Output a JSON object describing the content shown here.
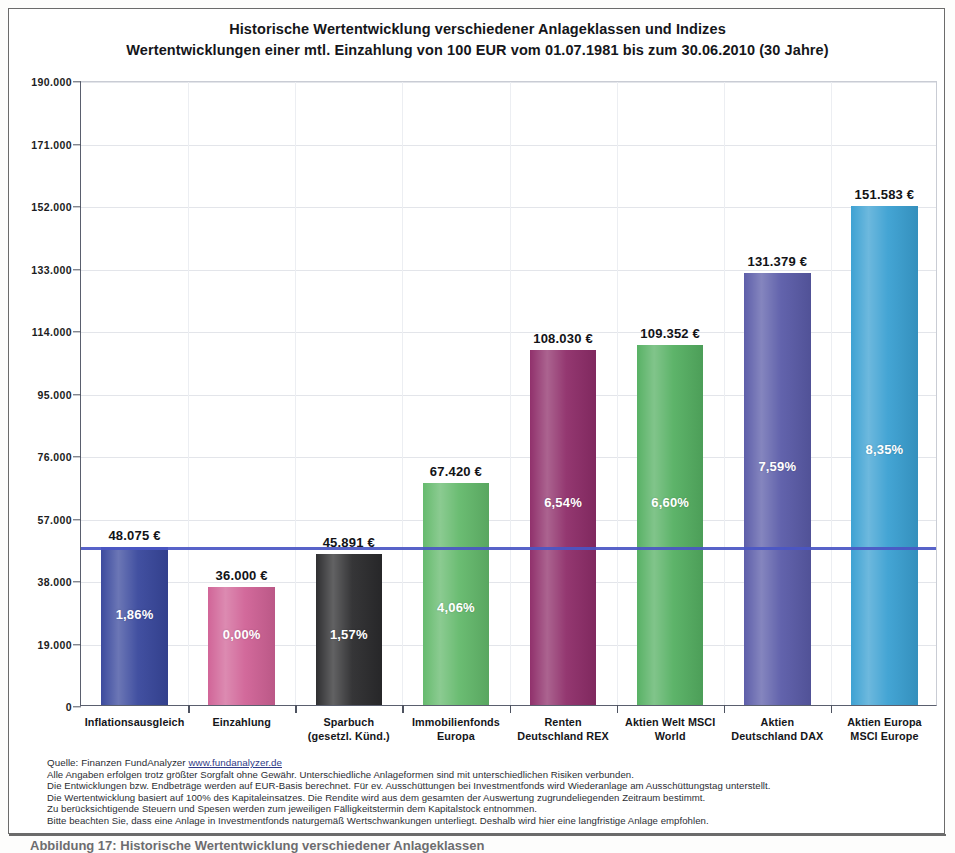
{
  "document": {
    "title_line1": "Historische Wertentwicklung verschiedener Anlageklassen und Indizes",
    "title_line2": "Wertentwicklungen einer mtl. Einzahlung von 100 EUR vom 01.07.1981 bis zum 30.06.2010 (30 Jahre)",
    "caption": "Abbildung 17: Historische Wertentwicklung verschiedener Anlageklassen"
  },
  "notes": {
    "source_prefix": "Quelle: Finanzen FundAnalyzer ",
    "source_link": "www.fundanalyzer.de",
    "lines": [
      "Alle Angaben erfolgen trotz größter Sorgfalt ohne Gewähr. Unterschiedliche Anlageformen sind mit unterschiedlichen Risiken verbunden.",
      "Die Entwicklungen bzw. Endbeträge werden auf EUR-Basis berechnet. Für ev. Ausschüttungen bei Investmentfonds wird Wiederanlage am Ausschüttungstag unterstellt.",
      "Die Wertentwicklung basiert auf 100% des Kapitaleinsatzes. Die Rendite wird aus dem gesamten der Auswertung zugrundeliegenden Zeitraum bestimmt.",
      "Zu berücksichtigende Steuern und Spesen werden zum jeweiligen Fälligkeitstermin dem Kapitalstock entnommen.",
      "Bitte beachten Sie, dass eine Anlage in Investmentfonds naturgemäß Wertschwankungen unterliegt. Deshalb wird hier eine langfristige Anlage empfohlen."
    ]
  },
  "chart_data": {
    "type": "bar",
    "title": "Historische Wertentwicklung verschiedener Anlageklassen und Indizes",
    "subtitle": "Wertentwicklungen einer mtl. Einzahlung von 100 EUR vom 01.07.1981 bis zum 30.06.2010 (30 Jahre)",
    "xlabel": "",
    "ylabel": "",
    "ylim": [
      0,
      190000
    ],
    "grid": true,
    "legend": "none",
    "ytick_labels": [
      "190.000",
      "171.000",
      "152.000",
      "133.000",
      "114.000",
      "95.000",
      "76.000",
      "57.000",
      "38.000",
      "19.000",
      "0"
    ],
    "ytick_values": [
      190000,
      171000,
      152000,
      133000,
      114000,
      95000,
      76000,
      57000,
      38000,
      19000,
      0
    ],
    "benchmark_line": {
      "value": 48075,
      "color": "#4a56c4",
      "label": "Inflationsausgleich"
    },
    "categories": [
      "Inflationsausgleich",
      "Einzahlung",
      "Sparbuch\n(gesetzl. Künd.)",
      "Immobilienfonds\nEuropa",
      "Renten\nDeutschland REX",
      "Aktien Welt MSCI\nWorld",
      "Aktien\nDeutschland DAX",
      "Aktien Europa\nMSCI Europe"
    ],
    "values": [
      48075,
      36000,
      45891,
      67420,
      108030,
      109352,
      131379,
      151583
    ],
    "value_labels": [
      "48.075 €",
      "36.000 €",
      "45.891 €",
      "67.420 €",
      "108.030 €",
      "109.352 €",
      "131.379 €",
      "151.583 €"
    ],
    "pct_labels": [
      "1,86%",
      "0,00%",
      "1,57%",
      "4,06%",
      "6,54%",
      "6,60%",
      "7,59%",
      "8,35%"
    ],
    "pct_values": [
      1.86,
      0.0,
      1.57,
      4.06,
      6.54,
      6.6,
      7.59,
      8.35
    ],
    "colors": [
      "#38479c",
      "#d06296",
      "#2b2b2d",
      "#63b96b",
      "#8e2d69",
      "#55b062",
      "#5a5ba8",
      "#3aa0d2"
    ],
    "pct_label_y": [
      28000,
      22000,
      22000,
      30000,
      62000,
      62000,
      73000,
      78000
    ]
  }
}
